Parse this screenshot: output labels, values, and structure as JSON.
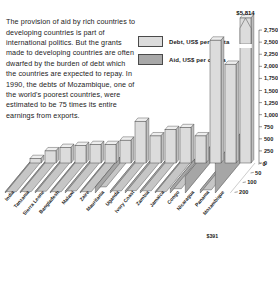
{
  "intro": {
    "text": "The provision of aid by rich countries to developing countries is part of international politics. But the grants made to developing countries are often dwarfed by the burden of debt which the countries are expected to repay. In 1990, the debts of Mozambique, one of the world's poorest countries, were estimated to be 75 times its entire earnings from exports."
  },
  "legend": {
    "items": [
      {
        "key": "debt",
        "label": "Debt, US$ per capita",
        "color": "#dcdcdc"
      },
      {
        "key": "aid",
        "label": "Aid, US$ per capita",
        "color": "#a8a8a8"
      }
    ]
  },
  "chart_data": {
    "type": "bar",
    "title": "",
    "xlabel": "",
    "ylabel": "",
    "ylim": [
      0,
      3000
    ],
    "grid": false,
    "legend_position": "top-center",
    "axis_break": true,
    "axis_break_note": "Mozambique debt bar is broken/truncated; true value annotated at top",
    "yticks": [
      0,
      250,
      500,
      750,
      1000,
      1250,
      1500,
      1750,
      2000,
      2250,
      2500,
      2750
    ],
    "ytick_labels": [
      "0",
      "250",
      "500",
      "750",
      "1,000",
      "1,250",
      "1,500",
      "1,750",
      "2,000",
      "2,250",
      "2,500",
      "2,750"
    ],
    "categories": [
      "India",
      "Tanzania",
      "Sierra Leone",
      "Bangladesh",
      "Malawi",
      "Zaire",
      "Mauritania",
      "Uganda",
      "Ivory Coast",
      "Zambia",
      "Jamaica",
      "Congo",
      "Nicaragua",
      "Panama",
      "Mozambique"
    ],
    "series": [
      {
        "name": "Debt, US$ per capita",
        "color": "#dcdcdc",
        "values": [
          90,
          250,
          320,
          360,
          380,
          380,
          470,
          860,
          560,
          690,
          730,
          560,
          2540,
          2040,
          5814
        ]
      },
      {
        "name": "Aid, US$ per capita",
        "color": "#a8a8a8",
        "values": [
          4,
          18,
          22,
          12,
          26,
          6,
          80,
          26,
          30,
          28,
          18,
          56,
          220,
          40,
          391
        ]
      }
    ],
    "aid_axis_labels": [
      "0",
      "50",
      "100",
      "200"
    ],
    "annotations": [
      {
        "text": "$5,814",
        "for": "Mozambique",
        "series": "Debt, US$ per capita"
      },
      {
        "text": "$391",
        "for": "Mozambique",
        "series": "Aid, US$ per capita"
      }
    ]
  }
}
